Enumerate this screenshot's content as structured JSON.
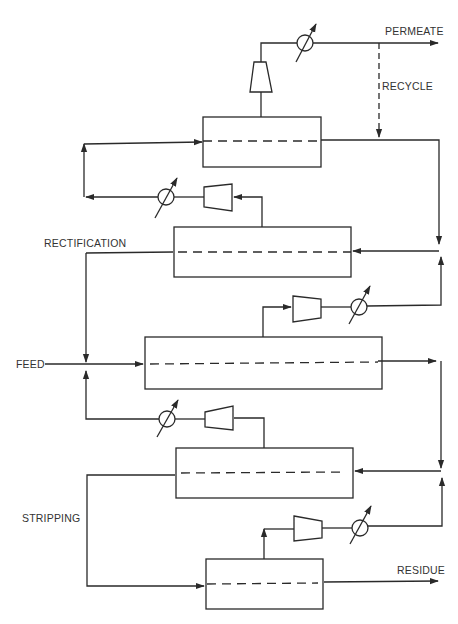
{
  "diagram": {
    "type": "membrane cascade process flow",
    "labels": {
      "permeate": "PERMEATE",
      "recycle": "RECYCLE",
      "rectification": "RECTIFICATION",
      "feed": "FEED",
      "stripping": "STRIPPING",
      "residue": "RESIDUE"
    },
    "stages": [
      {
        "id": "stage-1",
        "section": "rectification",
        "x": 203,
        "y": 117,
        "w": 118,
        "h": 50
      },
      {
        "id": "stage-2",
        "section": "rectification",
        "x": 174,
        "y": 227,
        "w": 177,
        "h": 50
      },
      {
        "id": "stage-3",
        "section": "feed",
        "x": 145,
        "y": 337,
        "w": 237,
        "h": 52
      },
      {
        "id": "stage-4",
        "section": "stripping",
        "x": 176,
        "y": 448,
        "w": 177,
        "h": 50
      },
      {
        "id": "stage-5",
        "section": "stripping",
        "x": 206,
        "y": 559,
        "w": 117,
        "h": 50
      }
    ],
    "equipment": {
      "compressors": 5,
      "heat_exchangers": 5
    },
    "colors": {
      "line": "#2a2a2a",
      "text": "#333333",
      "background": "#ffffff"
    }
  }
}
